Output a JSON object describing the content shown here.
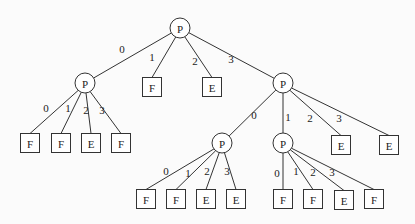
{
  "diagram": {
    "type": "tree",
    "nodes": [
      {
        "id": "root",
        "label": "P",
        "shape": "circle",
        "x": 180,
        "y": 28
      },
      {
        "id": "a",
        "label": "P",
        "shape": "circle",
        "x": 85,
        "y": 83
      },
      {
        "id": "b",
        "label": "F",
        "shape": "box",
        "x": 152,
        "y": 87
      },
      {
        "id": "c",
        "label": "E",
        "shape": "box",
        "x": 212,
        "y": 87
      },
      {
        "id": "d",
        "label": "P",
        "shape": "circle",
        "x": 283,
        "y": 83
      },
      {
        "id": "a0",
        "label": "F",
        "shape": "box",
        "x": 30,
        "y": 143
      },
      {
        "id": "a1",
        "label": "F",
        "shape": "box",
        "x": 61,
        "y": 143
      },
      {
        "id": "a2",
        "label": "E",
        "shape": "box",
        "x": 91,
        "y": 143
      },
      {
        "id": "a3",
        "label": "F",
        "shape": "box",
        "x": 121,
        "y": 143
      },
      {
        "id": "d0",
        "label": "P",
        "shape": "circle",
        "x": 222,
        "y": 143
      },
      {
        "id": "d1",
        "label": "P",
        "shape": "circle",
        "x": 283,
        "y": 143
      },
      {
        "id": "d2",
        "label": "E",
        "shape": "box",
        "x": 341,
        "y": 145
      },
      {
        "id": "d3",
        "label": "E",
        "shape": "box",
        "x": 389,
        "y": 145
      },
      {
        "id": "e0",
        "label": "F",
        "shape": "box",
        "x": 146,
        "y": 199
      },
      {
        "id": "e1",
        "label": "F",
        "shape": "box",
        "x": 176,
        "y": 199
      },
      {
        "id": "e2",
        "label": "E",
        "shape": "box",
        "x": 206,
        "y": 199
      },
      {
        "id": "e3",
        "label": "E",
        "shape": "box",
        "x": 236,
        "y": 199
      },
      {
        "id": "f0",
        "label": "F",
        "shape": "box",
        "x": 283,
        "y": 199
      },
      {
        "id": "f1",
        "label": "F",
        "shape": "box",
        "x": 313,
        "y": 199
      },
      {
        "id": "f2",
        "label": "E",
        "shape": "box",
        "x": 344,
        "y": 200
      },
      {
        "id": "f3",
        "label": "F",
        "shape": "box",
        "x": 374,
        "y": 199
      }
    ],
    "edges": [
      {
        "from": "root",
        "to": "a",
        "label": "0",
        "lx": 122,
        "ly": 49
      },
      {
        "from": "root",
        "to": "b",
        "label": "1",
        "lx": 152,
        "ly": 57
      },
      {
        "from": "root",
        "to": "c",
        "label": "2",
        "lx": 195,
        "ly": 61
      },
      {
        "from": "root",
        "to": "d",
        "label": "3",
        "lx": 231,
        "ly": 59
      },
      {
        "from": "a",
        "to": "a0",
        "label": "0",
        "lx": 46,
        "ly": 108
      },
      {
        "from": "a",
        "to": "a1",
        "label": "1",
        "lx": 68,
        "ly": 108
      },
      {
        "from": "a",
        "to": "a2",
        "label": "2",
        "lx": 86,
        "ly": 110
      },
      {
        "from": "a",
        "to": "a3",
        "label": "3",
        "lx": 102,
        "ly": 110
      },
      {
        "from": "d",
        "to": "d0",
        "label": "0",
        "lx": 254,
        "ly": 115
      },
      {
        "from": "d",
        "to": "d1",
        "label": "1",
        "lx": 288,
        "ly": 117
      },
      {
        "from": "d",
        "to": "d2",
        "label": "2",
        "lx": 310,
        "ly": 118
      },
      {
        "from": "d",
        "to": "d3",
        "label": "3",
        "lx": 339,
        "ly": 118
      },
      {
        "from": "d0",
        "to": "e0",
        "label": "0",
        "lx": 166,
        "ly": 171
      },
      {
        "from": "d0",
        "to": "e1",
        "label": "1",
        "lx": 188,
        "ly": 173
      },
      {
        "from": "d0",
        "to": "e2",
        "label": "2",
        "lx": 207,
        "ly": 171
      },
      {
        "from": "d0",
        "to": "e3",
        "label": "3",
        "lx": 227,
        "ly": 171
      },
      {
        "from": "d1",
        "to": "f0",
        "label": "0",
        "lx": 277,
        "ly": 173
      },
      {
        "from": "d1",
        "to": "f1",
        "label": "1",
        "lx": 296,
        "ly": 171
      },
      {
        "from": "d1",
        "to": "f2",
        "label": "2",
        "lx": 313,
        "ly": 172
      },
      {
        "from": "d1",
        "to": "f3",
        "label": "3",
        "lx": 332,
        "ly": 172
      }
    ]
  }
}
